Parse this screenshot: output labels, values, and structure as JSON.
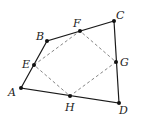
{
  "diagram": {
    "type": "quadrilateral-midpoints",
    "outer_quadrilateral": [
      "A",
      "B",
      "C",
      "D"
    ],
    "inner_quadrilateral": [
      "E",
      "F",
      "G",
      "H"
    ],
    "points": {
      "A": {
        "label": "A",
        "x": 21,
        "y": 88,
        "lx": 8,
        "ly": 96
      },
      "B": {
        "label": "B",
        "x": 47,
        "y": 41,
        "lx": 36,
        "ly": 40
      },
      "C": {
        "label": "C",
        "x": 114,
        "y": 21,
        "lx": 116,
        "ly": 19
      },
      "D": {
        "label": "D",
        "x": 119,
        "y": 103,
        "lx": 119,
        "ly": 114
      },
      "E": {
        "label": "E",
        "x": 34,
        "y": 65,
        "lx": 22,
        "ly": 68
      },
      "F": {
        "label": "F",
        "x": 80,
        "y": 31,
        "lx": 73,
        "ly": 27
      },
      "G": {
        "label": "G",
        "x": 116,
        "y": 62,
        "lx": 120,
        "ly": 66
      },
      "H": {
        "label": "H",
        "x": 70,
        "y": 96,
        "lx": 65,
        "ly": 111
      }
    },
    "colors": {
      "outline": "#1a1a1a",
      "dashed": "#777777",
      "point": "#111111"
    }
  }
}
